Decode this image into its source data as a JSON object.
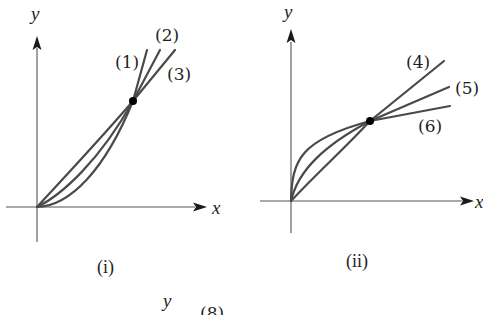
{
  "panels": [
    {
      "id": "i",
      "caption": "(i)",
      "x_axis_label": "x",
      "y_axis_label": "y",
      "description": "Three increasing curves through the origin, convex, meeting at a common point",
      "curves": [
        {
          "label": "(1)",
          "shape": "most convex, steepest beyond intersection"
        },
        {
          "label": "(2)",
          "shape": "intermediate convexity"
        },
        {
          "label": "(3)",
          "shape": "least convex (nearly straight), shallowest beyond intersection"
        }
      ],
      "intersection_point": "marked with black dot"
    },
    {
      "id": "ii",
      "caption": "(ii)",
      "x_axis_label": "x",
      "y_axis_label": "y",
      "description": "Three increasing curves through the origin, concave, meeting at a common point",
      "curves": [
        {
          "label": "(4)",
          "shape": "nearly straight, steepest beyond intersection"
        },
        {
          "label": "(5)",
          "shape": "intermediate concavity"
        },
        {
          "label": "(6)",
          "shape": "most concave, rises sharply near origin, flattest beyond intersection"
        }
      ],
      "intersection_point": "marked with black dot"
    }
  ],
  "partial_panel": {
    "y_axis_label": "y",
    "curve_label": "(8)"
  },
  "colors": {
    "curve": "#4a4a4a",
    "axis": "#555555",
    "text": "#1f1f1f",
    "background": "#ffffff"
  }
}
